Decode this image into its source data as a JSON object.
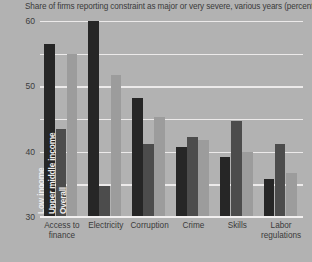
{
  "chart_data": {
    "type": "bar",
    "title": "Share of firms reporting constraint as major or very severe, various years (percent)",
    "xlabel": "",
    "ylabel": "",
    "ylim": [
      0,
      60
    ],
    "yticks": [
      0,
      10,
      20,
      30,
      40,
      50,
      60
    ],
    "grid": true,
    "legend_position": "overlaid-on-first-group",
    "categories": [
      "Access to\nfinance",
      "Electricity",
      "Corruption",
      "Crime",
      "Skills",
      "Labor\nregulations"
    ],
    "series": [
      {
        "name": "Low income",
        "color": "#262626",
        "values": [
          53,
          60,
          36.5,
          21.5,
          18.5,
          11.5
        ]
      },
      {
        "name": "Upper middle income",
        "color": "#4c4c4c",
        "values": [
          27,
          9.5,
          22.5,
          24.5,
          29.5,
          22.5
        ]
      },
      {
        "name": "Overall",
        "color": "#9c9c9c",
        "values": [
          50,
          43.5,
          30.5,
          23.5,
          20,
          13.5
        ]
      }
    ]
  },
  "colors": {
    "background": "#b2b2b2",
    "gridline": "#eceaea",
    "text": "#3a3a3a",
    "legend_text": "#f0eeee"
  }
}
